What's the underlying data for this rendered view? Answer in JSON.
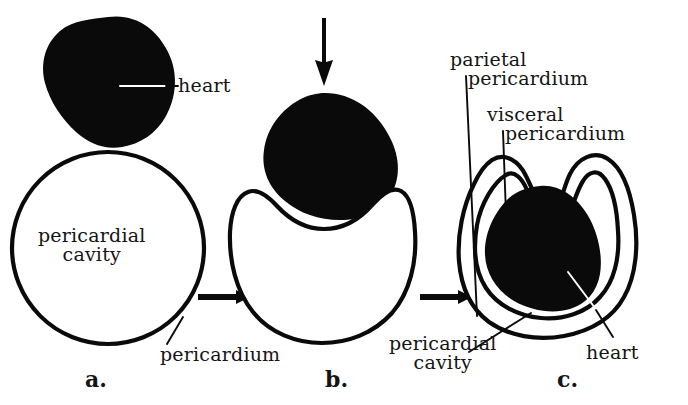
{
  "figure": {
    "background_color": "#ffffff",
    "ink_color": "#0a0a0a",
    "panels": [
      {
        "id": "a",
        "letter": "a.",
        "description": "Heart and pericardial sac before invagination",
        "labels": [
          "heart",
          "pericardial cavity",
          "pericardium"
        ]
      },
      {
        "id": "b",
        "letter": "b.",
        "description": "Heart pressing down into the pericardial sac",
        "labels": [
          "pericardium"
        ]
      },
      {
        "id": "c",
        "letter": "c.",
        "description": "Heart fully invaginated within the double-layered pericardium",
        "labels": [
          "parietal pericardium",
          "visceral pericardium",
          "pericardial cavity",
          "heart"
        ]
      }
    ]
  },
  "labels": {
    "heart_a": "heart",
    "pericardial_cavity_a_line1": "pericardial",
    "pericardial_cavity_a_line2": "cavity",
    "pericardium_a": "pericardium",
    "parietal_line1": "parietal",
    "parietal_line2": "pericardium",
    "visceral_line1": "visceral",
    "visceral_line2": "pericardium",
    "pericardial_cavity_c_line1": "pericardial",
    "pericardial_cavity_c_line2": "cavity",
    "heart_c": "heart"
  },
  "panel_letters": {
    "a": "a.",
    "b": "b.",
    "c": "c."
  },
  "arrows": {
    "transition_a_to_b": "right-arrow",
    "transition_b_to_c": "right-arrow",
    "push_down": "down-arrow"
  }
}
